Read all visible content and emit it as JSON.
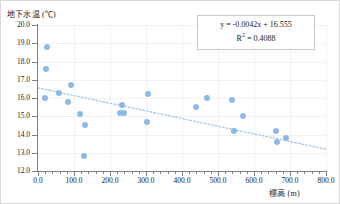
{
  "chart_data": {
    "type": "scatter",
    "title": "",
    "xlabel": "標高 (m)",
    "ylabel": "地下水温 (℃)",
    "xlim": [
      0.0,
      800.0
    ],
    "ylim": [
      12.0,
      20.0
    ],
    "grid": true,
    "legend": false,
    "xticks": [
      "0.0",
      "100.0",
      "200.0",
      "300.0",
      "400.0",
      "500.0",
      "600.0",
      "700.0",
      "800.0"
    ],
    "yticks": [
      "12.0",
      "13.0",
      "14.0",
      "15.0",
      "16.0",
      "17.0",
      "18.0",
      "19.0",
      "20.0"
    ],
    "marker_color": "#83b4e3",
    "trendline_color": "#9ec3e8",
    "annotation": {
      "equation": "y = -0.0042x + 16.555",
      "r_squared_label": "R",
      "r_squared_sup": "2",
      "r_squared_value": "= 0.4088"
    },
    "fit": {
      "slope": -0.0042,
      "intercept": 16.555,
      "r2": 0.4088
    },
    "points": [
      {
        "x": 25,
        "y": 18.8
      },
      {
        "x": 22,
        "y": 17.6
      },
      {
        "x": 20,
        "y": 16.0
      },
      {
        "x": 58,
        "y": 16.3
      },
      {
        "x": 92,
        "y": 16.7
      },
      {
        "x": 83,
        "y": 15.8
      },
      {
        "x": 118,
        "y": 15.1
      },
      {
        "x": 130,
        "y": 14.5
      },
      {
        "x": 128,
        "y": 12.8
      },
      {
        "x": 228,
        "y": 15.2
      },
      {
        "x": 238,
        "y": 15.2
      },
      {
        "x": 232,
        "y": 15.6
      },
      {
        "x": 305,
        "y": 16.2
      },
      {
        "x": 302,
        "y": 14.7
      },
      {
        "x": 440,
        "y": 15.5
      },
      {
        "x": 470,
        "y": 16.0
      },
      {
        "x": 540,
        "y": 15.9
      },
      {
        "x": 545,
        "y": 14.2
      },
      {
        "x": 570,
        "y": 15.0
      },
      {
        "x": 662,
        "y": 14.2
      },
      {
        "x": 665,
        "y": 13.6
      },
      {
        "x": 690,
        "y": 13.8
      }
    ]
  }
}
